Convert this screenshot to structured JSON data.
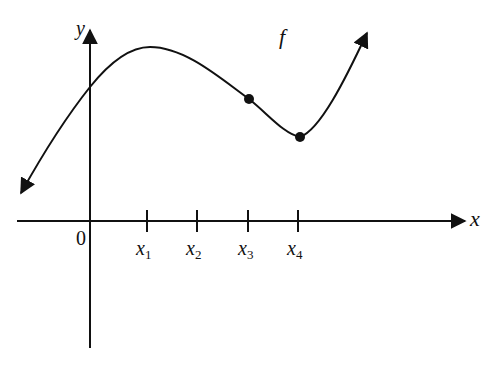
{
  "diagram": {
    "function_label": "f",
    "axes": {
      "x_label": "x",
      "y_label": "y",
      "origin_label": "0"
    },
    "ticks": [
      {
        "base": "x",
        "sub": "1"
      },
      {
        "base": "x",
        "sub": "2"
      },
      {
        "base": "x",
        "sub": "3"
      },
      {
        "base": "x",
        "sub": "4"
      }
    ],
    "marked_points": [
      "x3",
      "x4"
    ],
    "colors": {
      "stroke": "#111111",
      "background": "#ffffff"
    }
  }
}
